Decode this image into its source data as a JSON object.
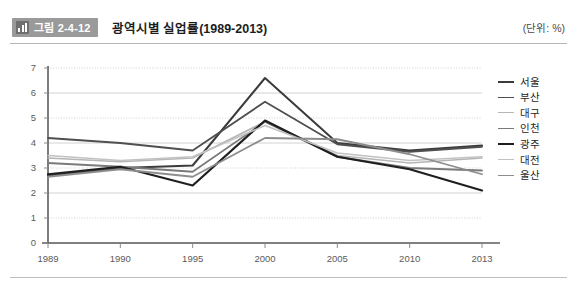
{
  "header": {
    "badge_label": "그림 2-4-12",
    "badge_icon": "bar-chart-icon",
    "title": "광역시별 실업률(1989-2013)",
    "unit_note": "(단위: %)"
  },
  "chart_data": {
    "type": "line",
    "title": "광역시별 실업률(1989-2013)",
    "xlabel": "",
    "ylabel": "",
    "unit": "%",
    "grid": true,
    "legend_position": "right",
    "categories": [
      "1989",
      "1990",
      "1995",
      "2000",
      "2005",
      "2010",
      "2013"
    ],
    "ylim": [
      0,
      7
    ],
    "ytick_step": 1,
    "yticks": [
      "0",
      "1",
      "2",
      "3",
      "4",
      "5",
      "6",
      "7"
    ],
    "series": [
      {
        "name": "서울",
        "color": "#3b3b3b",
        "width": 2.0,
        "values": [
          2.7,
          3.0,
          3.1,
          6.6,
          4.0,
          3.7,
          3.9
        ]
      },
      {
        "name": "부산",
        "color": "#4f4f4f",
        "width": 1.8,
        "values": [
          4.2,
          4.0,
          3.7,
          5.65,
          3.95,
          3.65,
          3.85
        ]
      },
      {
        "name": "대구",
        "color": "#b5b5b5",
        "width": 1.6,
        "values": [
          3.4,
          3.25,
          3.4,
          4.85,
          3.5,
          3.2,
          3.4
        ]
      },
      {
        "name": "인천",
        "color": "#7a7a7a",
        "width": 1.8,
        "values": [
          3.2,
          3.05,
          2.85,
          4.85,
          3.45,
          3.0,
          2.9
        ]
      },
      {
        "name": "광주",
        "color": "#1f1f1f",
        "width": 2.2,
        "values": [
          2.75,
          3.05,
          2.3,
          4.9,
          3.45,
          2.95,
          2.1
        ]
      },
      {
        "name": "대전",
        "color": "#c2c2c2",
        "width": 1.5,
        "values": [
          3.5,
          3.3,
          3.45,
          4.7,
          3.6,
          3.3,
          3.45
        ]
      },
      {
        "name": "울산",
        "color": "#8d8d8d",
        "width": 1.8,
        "values": [
          2.65,
          2.95,
          2.65,
          4.2,
          4.15,
          3.55,
          2.75
        ]
      }
    ]
  },
  "axis": {
    "x_tick_labels": [
      "1989",
      "1990",
      "1995",
      "2000",
      "2005",
      "2010",
      "2013"
    ],
    "y_tick_labels": [
      "7",
      "6",
      "5",
      "4",
      "3",
      "2",
      "1",
      "0"
    ]
  }
}
